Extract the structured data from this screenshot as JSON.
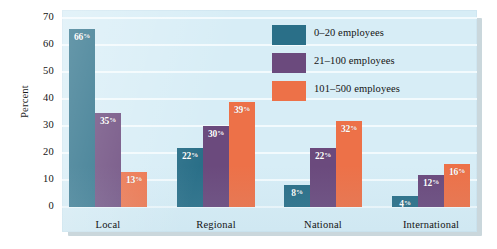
{
  "chart_data": {
    "type": "bar",
    "title": "",
    "xlabel": "",
    "ylabel": "Percent",
    "ylim": [
      0,
      70
    ],
    "yticks": [
      0,
      10,
      20,
      30,
      40,
      50,
      60,
      70
    ],
    "ytick_labels": [
      "0",
      "10",
      "20",
      "30",
      "40",
      "50",
      "60",
      "70"
    ],
    "grid": true,
    "legend_position": "upper right",
    "categories": [
      "Local",
      "Regional",
      "National",
      "International"
    ],
    "series": [
      {
        "name": "0–20 employees",
        "color": "#2a6f88",
        "values": [
          66,
          22,
          8,
          4
        ],
        "labels": [
          "66%",
          "22%",
          "8%",
          "4%"
        ]
      },
      {
        "name": "21–100 employees",
        "color": "#6b4a7d",
        "values": [
          35,
          30,
          22,
          12
        ],
        "labels": [
          "35%",
          "30%",
          "22%",
          "12%"
        ]
      },
      {
        "name": "101–500 employees",
        "color": "#ed7148",
        "values": [
          13,
          39,
          32,
          16
        ],
        "labels": [
          "13%",
          "39%",
          "32%",
          "16%"
        ]
      }
    ],
    "colors": {
      "plot_background": "#d7edf6",
      "gridline": "#f2fafd",
      "value_label": "#ffffff",
      "axis_text": "#141414"
    }
  }
}
